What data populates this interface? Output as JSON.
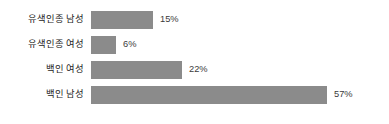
{
  "chart_data": {
    "type": "bar",
    "orientation": "horizontal",
    "title": "",
    "subtitle": "",
    "xlabel": "",
    "ylabel": "",
    "grid": false,
    "legend": "none",
    "xlim": [
      0,
      57
    ],
    "value_suffix": "%",
    "bar_color": "#8b8b8b",
    "label_color": "#232323",
    "value_color": "#3a3a3a",
    "background_color": "#ffffff",
    "categories": [
      "유색인종 남성",
      "유색인종 여성",
      "백인 여성",
      "백인 남성"
    ],
    "values": [
      15,
      6,
      22,
      57
    ],
    "value_labels": [
      "15%",
      "6%",
      "22%",
      "57%"
    ],
    "bars": [
      {
        "category": "유색인종 남성",
        "value": 15,
        "value_label": "15%",
        "width_px": 62
      },
      {
        "category": "유색인종 여성",
        "value": 6,
        "value_label": "6%",
        "width_px": 25
      },
      {
        "category": "백인 여성",
        "value": 22,
        "value_label": "22%",
        "width_px": 91
      },
      {
        "category": "백인 남성",
        "value": 57,
        "value_label": "57%",
        "width_px": 236
      }
    ]
  }
}
